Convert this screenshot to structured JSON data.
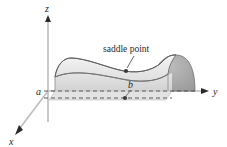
{
  "figure": {
    "type": "3d-surface-diagram",
    "background_color": "#ffffff",
    "title": "",
    "axes": {
      "z": {
        "label": "z",
        "direction": "up",
        "arrow": true,
        "color": "#b5b5b5"
      },
      "y": {
        "label": "y",
        "direction": "right",
        "arrow": true,
        "color": "#b5b5b5"
      },
      "x": {
        "label": "x",
        "direction": "down-left",
        "arrow": true,
        "color": "#b5b5b5"
      }
    },
    "annotations": {
      "saddle_point_label": "saddle point",
      "leader_line": true
    },
    "markers": {
      "saddle_point_a": {
        "label": "a"
      },
      "saddle_point_b": {
        "label": "b"
      }
    },
    "surface": {
      "name": "saddle-surface",
      "fill_top": "#e6e6e6",
      "fill_side": "#dcdcdc",
      "fill_endcap": "#a9a9a9",
      "stroke": "#6b6b6b"
    },
    "guides": {
      "dashed_line_color": "#555555",
      "dashed_count": 2
    }
  }
}
